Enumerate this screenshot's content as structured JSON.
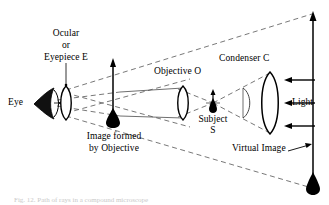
{
  "figure": {
    "background_color": "#ffffff",
    "ink_color": "#000000",
    "ray_color": "#555555",
    "width": 329,
    "height": 205
  },
  "labels": {
    "ocular_line1": "Ocular",
    "ocular_line2": "or",
    "ocular_line3": "Eyepiece  E",
    "eye": "Eye",
    "image_formed_line1": "Image formed",
    "image_formed_line2": "by Objective",
    "objective": "Objective   O",
    "subject_line1": "Subject",
    "subject_line2": "S",
    "condenser": "Condenser   C",
    "light": "Light",
    "virtual_image": "Virtual Image"
  },
  "caption": {
    "text": "Fig. 12. Path of rays in a compound microscope"
  },
  "components": [
    {
      "name": "eye",
      "kind": "eye-symbol",
      "x": 40,
      "y": 103
    },
    {
      "name": "eyepiece-lens",
      "kind": "biconvex-lens",
      "x": 66,
      "y": 103,
      "height": 34
    },
    {
      "name": "objective-lens",
      "kind": "biconvex-lens",
      "x": 183,
      "y": 103,
      "height": 34
    },
    {
      "name": "condenser-lens",
      "kind": "biconvex-lens",
      "x": 270,
      "y": 103,
      "height": 62
    },
    {
      "name": "mirror-arc",
      "kind": "arc",
      "x": 243,
      "y": 103
    },
    {
      "name": "subject-specimen",
      "kind": "small-arrow-up",
      "x": 213,
      "y": 103
    },
    {
      "name": "intermediate-image",
      "kind": "arrow-up",
      "x": 113,
      "y": 103,
      "top": 59
    },
    {
      "name": "virtual-image",
      "kind": "arrow-up",
      "x": 313,
      "y": 190,
      "top": 12
    },
    {
      "name": "light-rays",
      "kind": "arrows-left",
      "count": 3
    }
  ]
}
